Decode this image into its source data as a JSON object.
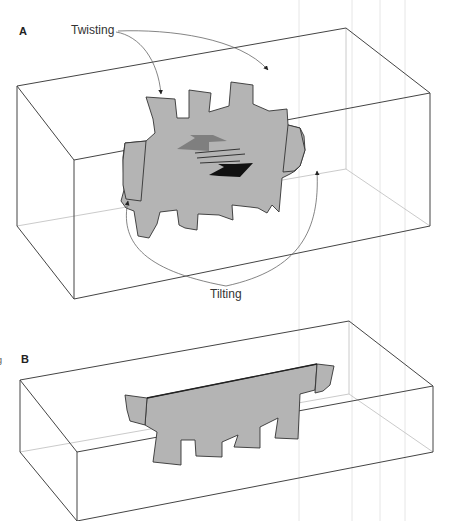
{
  "figure": {
    "panels": [
      {
        "id": "A",
        "label": "A",
        "annotations": {
          "top": "Twisting",
          "bottom": "Tilting"
        }
      },
      {
        "id": "B",
        "label": "B"
      }
    ],
    "edge_glyph": "g",
    "colors": {
      "box_line": "#444444",
      "box_hidden_line": "#bbbbbb",
      "surface_fill": "#b4b4b4",
      "surface_stroke": "#333333",
      "arrow_light": "#7f7f7f",
      "arrow_dark": "#111111",
      "annotation_line": "#666666",
      "background": "#ffffff"
    }
  }
}
